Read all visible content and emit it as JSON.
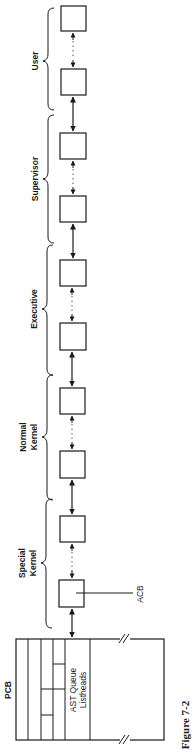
{
  "figure": {
    "caption": "Figure 7-2",
    "pcb_label": "PCB",
    "ast_queue_line1": "AST Queue",
    "ast_queue_line2": "Listheads",
    "acb_label": "ACB"
  },
  "groups": [
    {
      "id": "user",
      "line1": "User",
      "line2": ""
    },
    {
      "id": "supervisor",
      "line1": "Supervisor",
      "line2": ""
    },
    {
      "id": "executive",
      "line1": "Executive",
      "line2": ""
    },
    {
      "id": "normal-kernel",
      "line1": "Normal",
      "line2": "Kernel"
    },
    {
      "id": "special-kernel",
      "line1": "Special",
      "line2": "Kernel"
    }
  ],
  "colors": {
    "ink": "#1a1a1a",
    "background": "#ffffff"
  }
}
